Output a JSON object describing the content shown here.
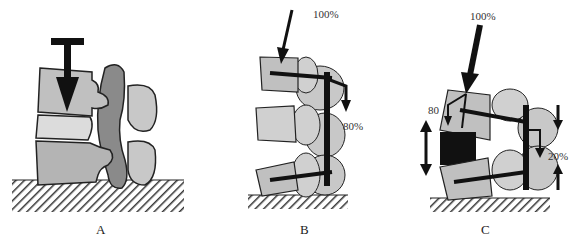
{
  "figure": {
    "panels": [
      {
        "id": "A",
        "label": "A",
        "annotations": []
      },
      {
        "id": "B",
        "label": "B",
        "annotations": [
          {
            "text": "100%"
          },
          {
            "text": "80%"
          }
        ]
      },
      {
        "id": "C",
        "label": "C",
        "annotations": [
          {
            "text": "100%"
          },
          {
            "text": "80"
          },
          {
            "text": "20%"
          }
        ]
      }
    ],
    "colors": {
      "vertebra_light": "#c8c8c8",
      "vertebra_mid": "#b4b4b4",
      "disc": "#dcdcdc",
      "facet_dark": "#8a8a8a",
      "ink": "#111111",
      "ground_hatch": "#333333"
    }
  }
}
